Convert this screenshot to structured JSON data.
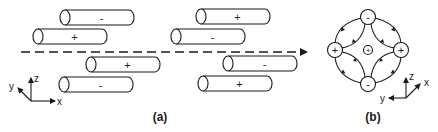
{
  "panels": {
    "a": {
      "label": "(a)",
      "cylinders": [
        {
          "sign": "-",
          "x": 65,
          "y": 10
        },
        {
          "sign": "+",
          "x": 38,
          "y": 29
        },
        {
          "sign": "+",
          "x": 91,
          "y": 57
        },
        {
          "sign": "-",
          "x": 64,
          "y": 77
        },
        {
          "sign": "+",
          "x": 201,
          "y": 9
        },
        {
          "sign": "-",
          "x": 176,
          "y": 29
        },
        {
          "sign": "-",
          "x": 228,
          "y": 56
        },
        {
          "sign": "+",
          "x": 203,
          "y": 76
        }
      ],
      "axes": {
        "z": "z",
        "y": "y",
        "x": "x"
      }
    },
    "b": {
      "label": "(b)",
      "nodes": {
        "top": "-",
        "bottom": "-",
        "left": "+",
        "right": "+",
        "center": "+"
      },
      "axes": {
        "z": "z",
        "x": "x",
        "y": "y"
      }
    }
  }
}
